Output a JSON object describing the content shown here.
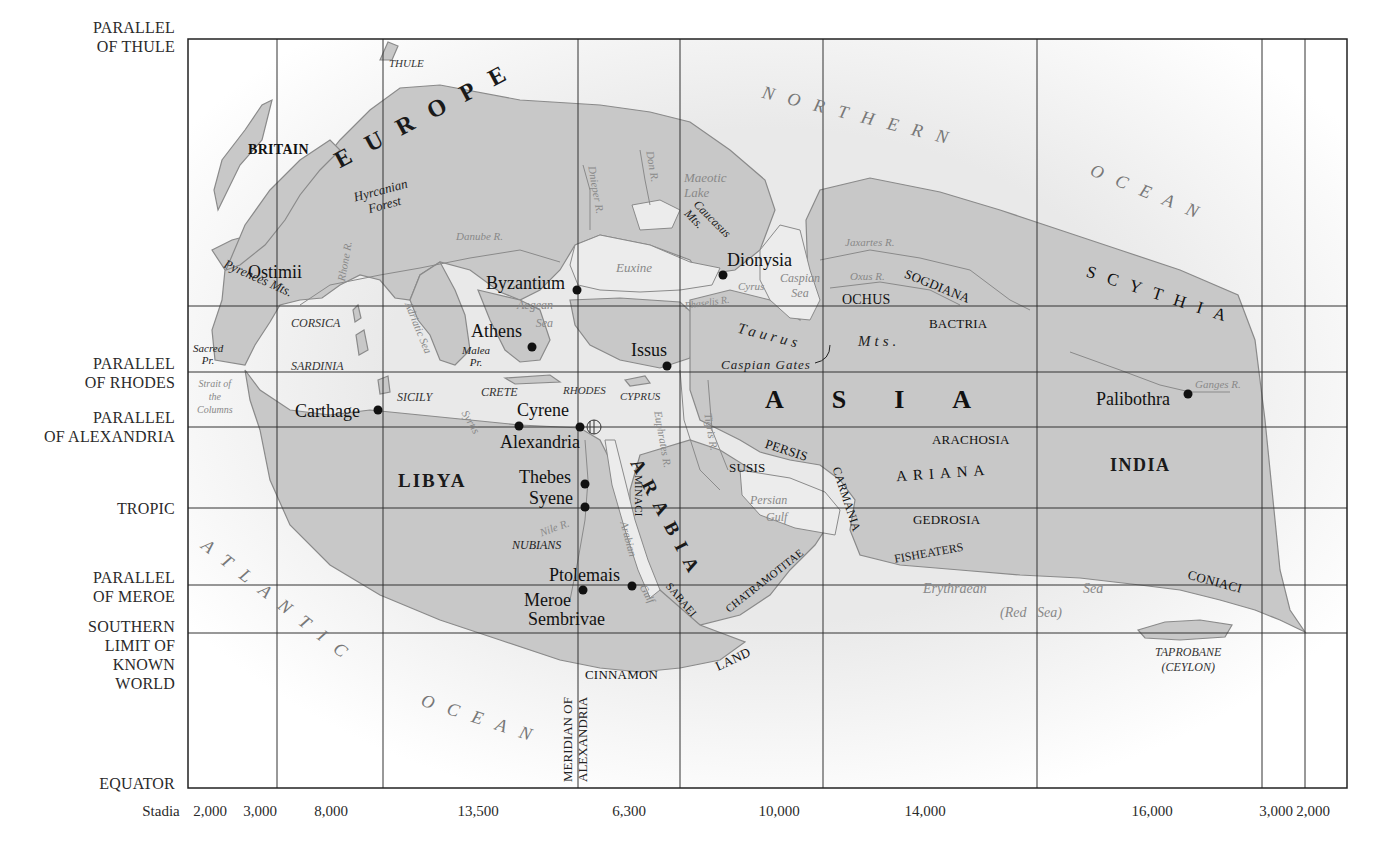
{
  "map": {
    "title": "Eratosthenes' map of the known world",
    "colors": {
      "land": "#c8c8c8",
      "land_edge": "#8a8a8a",
      "sea": "#f4f4f4",
      "grid": "#333333",
      "text": "#1a1a1a",
      "water_text": "#888888"
    },
    "frame": {
      "left": 188,
      "top": 39,
      "right": 1347,
      "bottom": 788
    },
    "parallels": [
      {
        "label_line1": "PARALLEL",
        "label_line2": "OF THULE",
        "y": 39
      },
      {
        "label_line1": "PARALLEL",
        "label_line2": "OF RHODES",
        "y": 372
      },
      {
        "label_line1": "PARALLEL",
        "label_line2": "OF ALEXANDRIA",
        "y": 427
      },
      {
        "label_line1": "TROPIC",
        "label_line2": "",
        "y": 508
      },
      {
        "label_line1": "PARALLEL",
        "label_line2": "OF MEROE",
        "y": 585
      },
      {
        "label_line1": "SOUTHERN",
        "label_line2": "LIMIT OF",
        "label_line3": "KNOWN",
        "label_line4": "WORLD",
        "y": 633
      },
      {
        "label_line1": "EQUATOR",
        "label_line2": "",
        "y": 788
      }
    ],
    "unlabeled_parallel_y": 306,
    "meridians_x": [
      277,
      383,
      578,
      680,
      823,
      1037,
      1262,
      1305
    ],
    "stadia": {
      "label": "Stadia",
      "values": [
        "2,000",
        "3,000",
        "8,000",
        "13,500",
        "6,300",
        "10,000",
        "14,000",
        "16,000",
        "3,000",
        "2,000"
      ]
    },
    "meridian_label": {
      "line1": "MERIDIAN OF",
      "line2": "ALEXANDRIA"
    },
    "oceans": {
      "northern_1": "NORTHERN",
      "northern_2": "OCEAN",
      "atlantic_1": "ATLANTIC",
      "atlantic_2": "OCEAN"
    },
    "continents": {
      "europe": "EUROPE",
      "asia": "ASIA",
      "libya": "LIBYA",
      "arabia": "ARABIA",
      "scythia": "SCYTHIA",
      "india": "INDIA",
      "ariana": "ARIANA"
    },
    "cities": [
      {
        "name": "Ostimii"
      },
      {
        "name": "Byzantium"
      },
      {
        "name": "Dionysia"
      },
      {
        "name": "Athens"
      },
      {
        "name": "Issus"
      },
      {
        "name": "Carthage"
      },
      {
        "name": "Cyrene"
      },
      {
        "name": "Alexandria"
      },
      {
        "name": "Thebes"
      },
      {
        "name": "Syene"
      },
      {
        "name": "Ptolemais"
      },
      {
        "name": "Meroe"
      },
      {
        "name": "Sembrivae"
      },
      {
        "name": "Palibothra"
      }
    ],
    "regions": {
      "britain": "BRITAIN",
      "sogdiana": "SOGDIANA",
      "ochus": "OCHUS",
      "bactria": "BACTRIA",
      "arachosia": "ARACHOSIA",
      "gedrosia": "GEDROSIA",
      "persis": "PERSIS",
      "susis": "SUSIS",
      "carmania": "CARMANIA",
      "minaci": "MINACI",
      "sabaei": "SABAEI",
      "chatramotitae": "CHATRAMOTITAE",
      "coniaci": "CONIACI",
      "fisheaters": "FISHEATERS",
      "cinnamon": "CINNAMON",
      "land": "LAND",
      "nubians": "NUBIANS",
      "corsica": "CORSICA",
      "sardinia": "SARDINIA",
      "sicily": "SICILY",
      "crete": "CRETE",
      "rhodes": "RHODES",
      "cyprus": "CYPRUS",
      "thule": "THULE",
      "taprobane": "TAPROBANE",
      "ceylon": "(CEYLON)"
    },
    "features": {
      "hyrcanian_1": "Hyrcanian",
      "hyrcanian_2": "Forest",
      "pyrenees": "Pyrenees Mts.",
      "caucasus_1": "Caucasus",
      "caucasus_2": "Mts.",
      "taurus": "Taurus",
      "taurus_mts": "Mts.",
      "caspian_gates": "Caspian Gates",
      "malea_1": "Malea",
      "malea_2": "Pr.",
      "sacred_1": "Sacred",
      "sacred_2": "Pr."
    },
    "waters": {
      "danube": "Danube R.",
      "dnieper": "Dnieper R.",
      "don": "Don R.",
      "maeotic_1": "Maeotic",
      "maeotic_2": "Lake",
      "euxine": "Euxine",
      "caspian_1": "Caspian",
      "caspian_2": "Sea",
      "jaxartes": "Jaxartes R.",
      "oxus": "Oxus R.",
      "cyrus": "Cyrus",
      "phaselis": "Phaselis R.",
      "rhone": "Rhone R.",
      "adriatic": "Adriatic Sea",
      "aegean_1": "Aegean",
      "aegean_2": "Sea",
      "strait_1": "Strait of",
      "strait_2": "the",
      "strait_3": "Columns",
      "syrtis": "Syrtis",
      "euphrates": "Euphrates R.",
      "tigris": "Tigris R.",
      "persian_1": "Persian",
      "persian_2": "Gulf",
      "nile": "Nile R.",
      "arabian_1": "Arabian",
      "arabian_2": "Gulf",
      "erythraean": "Erythraean",
      "erythraean_sea": "Sea",
      "red_sea": "(Red   Sea)",
      "ganges": "Ganges R."
    }
  }
}
